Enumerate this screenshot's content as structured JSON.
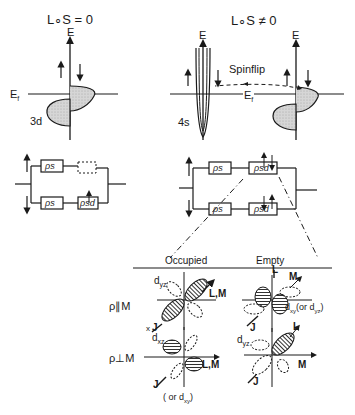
{
  "left_panel": {
    "title": "L∘S = 0",
    "axis_label": "E",
    "fermi_label": "E",
    "fermi_sub": "f",
    "band_label": "3d",
    "spin_up": "↑",
    "spin_down": "↓"
  },
  "right_panel": {
    "title": "L∘S ≠ 0",
    "axis_label_s": "E",
    "axis_label_d": "E",
    "fermi_label": "E",
    "fermi_sub": "f",
    "band_label": "4s",
    "spinflip_label": "Spinflip"
  },
  "circuit_left": {
    "upper_resistors": [
      "ρs",
      ""
    ],
    "lower_resistors": [
      "ρs",
      "ρsd"
    ]
  },
  "circuit_right": {
    "upper_resistors": [
      "ρs",
      "ρsd"
    ],
    "lower_resistors": [
      "ρs",
      "ρsd"
    ]
  },
  "orbital_table": {
    "col_occupied": "Occupied",
    "col_empty": "Empty",
    "row_parallel": "ρ∥M",
    "row_perp": "ρ⊥M",
    "cells": {
      "par_occ": {
        "orbital": "d",
        "sub": "yz",
        "axis_label": "L,M",
        "j_label": "J",
        "x_label": "x"
      },
      "par_emp": {
        "orbital": "d",
        "sub": "xy",
        "note": "(or d",
        "note_sub": "yz",
        "note_end": ")",
        "l_label": "L",
        "m_label": "M",
        "j_label": "J"
      },
      "perp_occ": {
        "orbital": "d",
        "sub": "xz",
        "axis_label": "L,M",
        "j_label": "J",
        "note": "( or d",
        "note_sub": "xy",
        "note_end": ")"
      },
      "perp_emp": {
        "orbital": "d",
        "sub": "yz",
        "l_label": "L",
        "m_label": "M",
        "j_label": "J"
      }
    }
  }
}
